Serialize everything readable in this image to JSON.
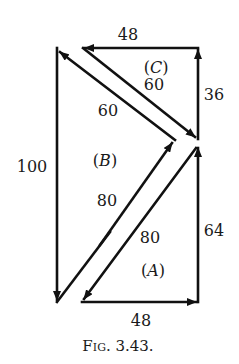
{
  "figure": {
    "caption": "Fig. 3.43.",
    "caption_fig": "F",
    "caption_ig": "IG",
    "caption_num": ". 3.43.",
    "colors": {
      "line": "#111111",
      "text": "#1a1a1a",
      "background": "#ffffff"
    }
  },
  "triangles": {
    "A": {
      "label": "(A)",
      "label_inner": "A",
      "sides": {
        "horizontal": "48",
        "vertical": "64",
        "hypotenuse": "80"
      }
    },
    "B": {
      "label": "(B)",
      "label_inner": "B",
      "sides": {
        "vertical": "100",
        "upper": "60",
        "lower": "80"
      }
    },
    "C": {
      "label": "(C)",
      "label_inner": "C",
      "sides": {
        "horizontal": "48",
        "vertical": "36",
        "hypotenuse": "60"
      }
    }
  },
  "labels": {
    "top_48": "48",
    "bottom_48": "48",
    "right_36": "36",
    "right_64": "64",
    "left_100": "100",
    "c_60": "60",
    "b_60": "60",
    "b_80": "80",
    "a_80": "80"
  }
}
